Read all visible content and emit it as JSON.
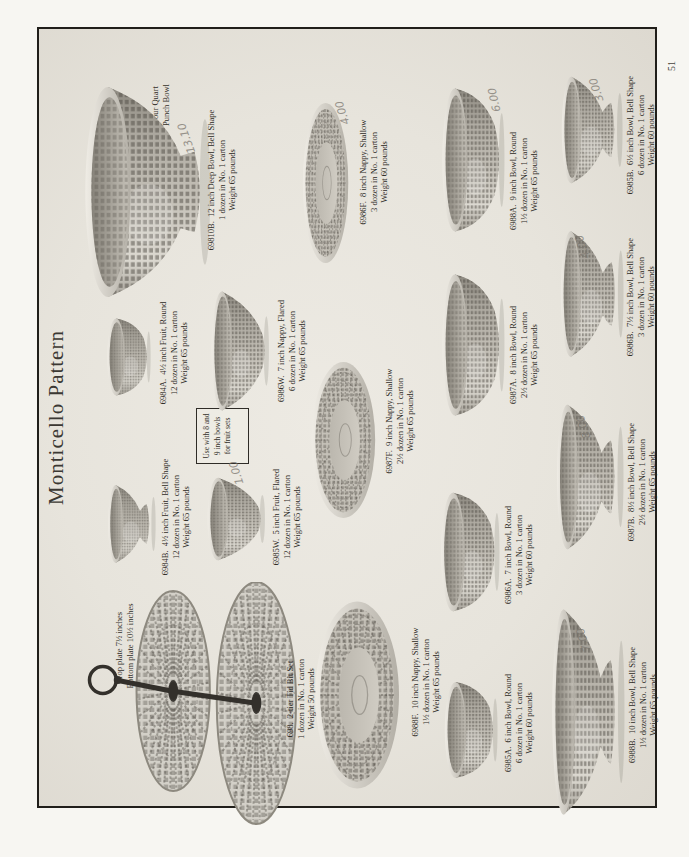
{
  "page": {
    "title": "Monticello Pattern",
    "page_number": "51"
  },
  "colors": {
    "paper": "#f7f6f2",
    "plate_background": "#e9e6df",
    "ink": "#2e2b26",
    "frame": "#201e1a",
    "glass_light": "#dcd9d1",
    "glass_dark": "#8e8a81",
    "pencil": "#7b766f"
  },
  "notes": {
    "fruit_box_lines": [
      "Use with 8 and",
      "9 inch bowls",
      "for fruit sets"
    ],
    "punch_label_lines": [
      "Four Quart",
      "Punch Bowl"
    ],
    "tidbit_label_lines": [
      "Top plate 7½ inches",
      "Bottom plate 10½ inches"
    ]
  },
  "items": [
    {
      "id": "69810B",
      "shape": "punch",
      "cx": 665,
      "cy": 146,
      "w": 222,
      "h": 130,
      "cap_cx": 677,
      "cap_top": 206,
      "caption": [
        "69810B.  12 inch Deep Bowl, Bell Shape",
        "1 dozen in No. 1 carton",
        "Weight 65 pounds"
      ]
    },
    {
      "id": "698",
      "shape": "tidbit",
      "cx": 150,
      "cy": 192,
      "w": 250,
      "h": 213,
      "cap_cx": 158,
      "cap_top": 285,
      "caption": [
        "698.  2-tier Tid Bit Set",
        "1 dozen in No. 1 carton",
        "Weight 50 pounds"
      ]
    },
    {
      "id": "6984B",
      "shape": "bell",
      "cx": 333,
      "cy": 131,
      "w": 82,
      "h": 50,
      "cap_cx": 340,
      "cap_top": 160,
      "caption": [
        "6984B.  4½ inch Fruit, Bell Shape",
        "12 dozen in No. 1 carton",
        "Weight 65 pounds"
      ]
    },
    {
      "id": "6984A",
      "shape": "round",
      "cx": 500,
      "cy": 128,
      "w": 82,
      "h": 46,
      "cap_cx": 504,
      "cap_top": 158,
      "caption": [
        "6984A.  4½ inch Fruit, Round",
        "12 dozen in No. 1 carton",
        "Weight 65 pounds"
      ]
    },
    {
      "id": "6985W",
      "shape": "flared",
      "cx": 338,
      "cy": 236,
      "w": 86,
      "h": 62,
      "cap_cx": 340,
      "cap_top": 271,
      "caption": [
        "6985W.  5 inch Fruit, Flared",
        "12 dozen in No. 1 carton",
        "Weight 65 pounds"
      ]
    },
    {
      "id": "6986W",
      "shape": "flared",
      "cx": 506,
      "cy": 240,
      "w": 124,
      "h": 62,
      "cap_cx": 506,
      "cap_top": 276,
      "caption": [
        "6986W.  7 inch Nappy, Flared",
        "6 dozen in No. 1 carton",
        "Weight 65 pounds"
      ]
    },
    {
      "id": "6986F",
      "shape": "shallow",
      "cx": 674,
      "cy": 326,
      "w": 166,
      "h": 50,
      "cap_cx": 685,
      "cap_top": 358,
      "caption": [
        "6986F.  8 inch Nappy, Shallow",
        "3 dozen in No. 1 carton",
        "Weight 60 pounds"
      ]
    },
    {
      "id": "6987F",
      "shape": "shallow",
      "cx": 417,
      "cy": 344,
      "w": 162,
      "h": 70,
      "cap_cx": 436,
      "cap_top": 384,
      "caption": [
        "6987F.  9 inch Nappy, Shallow",
        "2½ dozen in No. 1 carton",
        "Weight 65 pounds"
      ]
    },
    {
      "id": "6988F",
      "shape": "shallow",
      "cx": 162,
      "cy": 358,
      "w": 194,
      "h": 92,
      "cap_cx": 175,
      "cap_top": 410,
      "caption": [
        "6988F.  10 inch Nappy, Shallow",
        "1½ dozen in No. 1 carton",
        "Weight 65 pounds"
      ]
    },
    {
      "id": "6985A",
      "shape": "round",
      "cx": 127,
      "cy": 470,
      "w": 102,
      "h": 56,
      "cap_cx": 134,
      "cap_top": 503,
      "caption": [
        "6985A.  6 inch Bowl, Round",
        "6 dozen in No. 1 carton",
        "Weight 60 pounds"
      ]
    },
    {
      "id": "6986A",
      "shape": "round",
      "cx": 305,
      "cy": 469,
      "w": 126,
      "h": 62,
      "cap_cx": 302,
      "cap_top": 503,
      "caption": [
        "6986A.  7 inch Bowl, Round",
        "3 dozen in No. 1 carton",
        "Weight 60 pounds"
      ]
    },
    {
      "id": "6987A",
      "shape": "round",
      "cx": 512,
      "cy": 472,
      "w": 150,
      "h": 66,
      "cap_cx": 502,
      "cap_top": 508,
      "caption": [
        "6987A.  8 inch Bowl, Round",
        "2½ dozen in No. 1 carton",
        "Weight 65 pounds"
      ]
    },
    {
      "id": "6988A",
      "shape": "round",
      "cx": 697,
      "cy": 472,
      "w": 152,
      "h": 66,
      "cap_cx": 676,
      "cap_top": 508,
      "caption": [
        "6988A.  9 inch Bowl, Round",
        "1½ dozen in No. 1 carton",
        "Weight 65 pounds"
      ]
    },
    {
      "id": "6985B",
      "shape": "bell",
      "cx": 727,
      "cy": 591,
      "w": 112,
      "h": 64,
      "cap_cx": 722,
      "cap_top": 625,
      "caption": [
        "6985B.  6½ inch Bowl, Bell Shape",
        "6 dozen in No. 1 carton",
        "Weight 60 pounds"
      ]
    },
    {
      "id": "6986B",
      "shape": "bell",
      "cx": 563,
      "cy": 591,
      "w": 132,
      "h": 66,
      "cap_cx": 560,
      "cap_top": 625,
      "caption": [
        "6986B.  7½ inch Bowl, Bell Shape",
        "3 dozen in No. 1 carton",
        "Weight 60 pounds"
      ]
    },
    {
      "id": "6987B",
      "shape": "bell",
      "cx": 380,
      "cy": 589,
      "w": 152,
      "h": 70,
      "cap_cx": 375,
      "cap_top": 626,
      "caption": [
        "6987B.  8½ inch Bowl, Bell Shape",
        "2½ dozen in No. 1 carton",
        "Weight 65 pounds"
      ]
    },
    {
      "id": "6988B",
      "shape": "bell",
      "cx": 145,
      "cy": 587,
      "w": 216,
      "h": 76,
      "cap_cx": 152,
      "cap_top": 627,
      "caption": [
        "6988B.  10 inch Bowl, Bell Shape",
        "1½ dozen in No. 1 carton",
        "Weight 65 pounds"
      ]
    }
  ],
  "pencil_marks": [
    {
      "text": "13.10",
      "x": 703,
      "y": 180,
      "rot": -20
    },
    {
      "text": "1.00",
      "x": 372,
      "y": 230,
      "rot": -18
    },
    {
      "text": "4.00",
      "x": 732,
      "y": 336,
      "rot": -18
    },
    {
      "text": "6.00",
      "x": 745,
      "y": 488,
      "rot": -12
    },
    {
      "text": "3.00",
      "x": 755,
      "y": 590,
      "rot": -18
    },
    {
      "text": "4.00",
      "x": 598,
      "y": 576,
      "rot": -18
    },
    {
      "text": "8.00",
      "x": 418,
      "y": 577,
      "rot": -18
    },
    {
      "text": "7.00",
      "x": 205,
      "y": 577,
      "rot": -18
    }
  ]
}
